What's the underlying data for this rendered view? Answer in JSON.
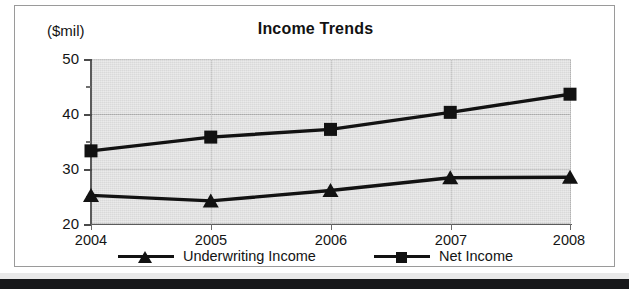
{
  "chart_data": {
    "type": "line",
    "title": "Income Trends",
    "xlabel": "",
    "ylabel": "($mil)",
    "ylim": [
      20,
      50
    ],
    "yticks": [
      20,
      30,
      40,
      50
    ],
    "yticks_minor": [
      25,
      35,
      45
    ],
    "grid": true,
    "legend_position": "bottom",
    "categories": [
      "2004",
      "2005",
      "2006",
      "2007",
      "2008"
    ],
    "series": [
      {
        "name": "Underwriting Income",
        "marker": "triangle",
        "color": "#121212",
        "values": [
          25.2,
          24.2,
          26.1,
          28.4,
          28.5
        ]
      },
      {
        "name": "Net Income",
        "marker": "square",
        "color": "#121212",
        "values": [
          33.3,
          35.8,
          37.2,
          40.3,
          43.6
        ]
      }
    ]
  },
  "axis": {
    "unit_label": "($mil)",
    "y_tick_labels": [
      "50",
      "40",
      "30",
      "20"
    ],
    "x_tick_labels": [
      "2004",
      "2005",
      "2006",
      "2007",
      "2008"
    ]
  },
  "legend": {
    "entries": [
      {
        "label": "Underwriting Income",
        "marker": "triangle"
      },
      {
        "label": "Net Income",
        "marker": "square"
      }
    ]
  },
  "colors": {
    "plot_background": "#d9d9d9",
    "series_ink": "#121212",
    "gridline": "#a9a9a9",
    "frame_border": "#9a9a9a"
  }
}
